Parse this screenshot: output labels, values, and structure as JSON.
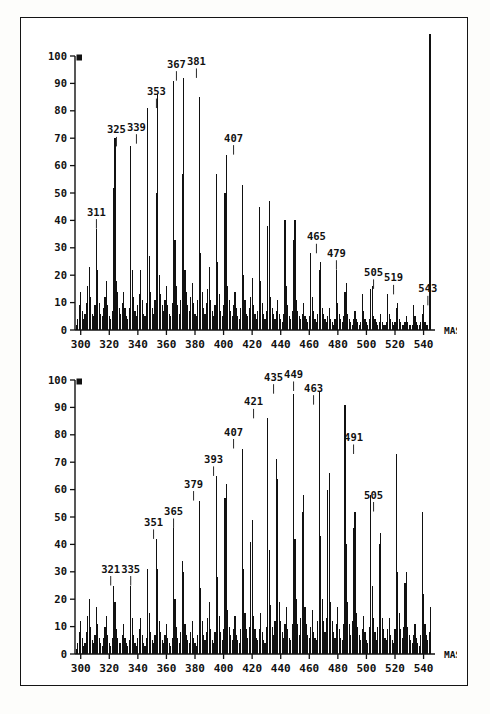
{
  "document": {
    "kind": "mass-spectrum-figure",
    "panel_count": 2,
    "border_color": "#141414",
    "background_color": "#ffffff",
    "ink_color": "#111111"
  },
  "chart_data": [
    {
      "type": "bar",
      "title": "",
      "subtitle": "",
      "xlabel": "MASS",
      "ylabel": "",
      "xlim": [
        296,
        548
      ],
      "ylim": [
        0,
        100
      ],
      "grid": false,
      "legend": "none",
      "xticks": [
        300,
        320,
        340,
        360,
        380,
        400,
        420,
        440,
        460,
        480,
        500,
        520,
        540
      ],
      "yticks": [
        0,
        10,
        20,
        30,
        40,
        50,
        60,
        70,
        80,
        90,
        100
      ],
      "full_scale_marker": "100",
      "annotations": [
        {
          "x": 311,
          "label": "311",
          "y": 37
        },
        {
          "x": 325,
          "label": "325",
          "y": 67
        },
        {
          "x": 339,
          "label": "339",
          "y": 68
        },
        {
          "x": 353,
          "label": "353",
          "y": 81
        },
        {
          "x": 367,
          "label": "367",
          "y": 91
        },
        {
          "x": 381,
          "label": "381",
          "y": 92
        },
        {
          "x": 407,
          "label": "407",
          "y": 64
        },
        {
          "x": 465,
          "label": "465",
          "y": 28
        },
        {
          "x": 479,
          "label": "479",
          "y": 22
        },
        {
          "x": 505,
          "label": "505",
          "y": 15
        },
        {
          "x": 519,
          "label": "519",
          "y": 13
        },
        {
          "x": 543,
          "label": "543",
          "y": 9
        }
      ],
      "x": [
        297,
        298,
        299,
        300,
        301,
        302,
        303,
        304,
        305,
        306,
        307,
        308,
        309,
        310,
        311,
        312,
        313,
        314,
        315,
        316,
        317,
        318,
        319,
        320,
        321,
        322,
        323,
        324,
        325,
        326,
        327,
        328,
        329,
        330,
        331,
        332,
        333,
        334,
        335,
        336,
        337,
        338,
        339,
        340,
        341,
        342,
        343,
        344,
        345,
        346,
        347,
        348,
        349,
        350,
        351,
        352,
        353,
        354,
        355,
        356,
        357,
        358,
        359,
        360,
        361,
        362,
        363,
        364,
        365,
        366,
        367,
        368,
        369,
        370,
        371,
        372,
        373,
        374,
        375,
        376,
        377,
        378,
        379,
        380,
        381,
        382,
        383,
        384,
        385,
        386,
        387,
        388,
        389,
        390,
        391,
        392,
        393,
        394,
        395,
        396,
        397,
        398,
        399,
        400,
        401,
        402,
        403,
        404,
        405,
        406,
        407,
        408,
        409,
        410,
        411,
        412,
        413,
        414,
        415,
        416,
        417,
        418,
        419,
        420,
        421,
        422,
        423,
        424,
        425,
        426,
        427,
        428,
        429,
        430,
        431,
        432,
        433,
        434,
        435,
        436,
        437,
        438,
        439,
        440,
        441,
        442,
        443,
        444,
        445,
        446,
        447,
        448,
        449,
        450,
        451,
        452,
        453,
        454,
        455,
        456,
        457,
        458,
        459,
        460,
        461,
        462,
        463,
        464,
        465,
        466,
        467,
        468,
        469,
        470,
        471,
        472,
        473,
        474,
        475,
        476,
        477,
        478,
        479,
        480,
        481,
        482,
        483,
        484,
        485,
        486,
        487,
        488,
        489,
        490,
        491,
        492,
        493,
        494,
        495,
        496,
        497,
        498,
        499,
        500,
        501,
        502,
        503,
        504,
        505,
        506,
        507,
        508,
        509,
        510,
        511,
        512,
        513,
        514,
        515,
        516,
        517,
        518,
        519,
        520,
        521,
        522,
        523,
        524,
        525,
        526,
        527,
        528,
        529,
        530,
        531,
        532,
        533,
        534,
        535,
        536,
        537,
        538,
        539,
        540,
        541,
        542,
        543,
        544,
        545
      ],
      "values": [
        2,
        4,
        9,
        14,
        7,
        4,
        6,
        10,
        16,
        23,
        12,
        6,
        5,
        9,
        37,
        22,
        10,
        6,
        5,
        8,
        12,
        18,
        9,
        5,
        4,
        7,
        52,
        70,
        18,
        14,
        8,
        6,
        10,
        14,
        8,
        5,
        4,
        8,
        67,
        22,
        12,
        7,
        5,
        9,
        13,
        22,
        11,
        6,
        5,
        10,
        81,
        27,
        14,
        8,
        6,
        11,
        50,
        86,
        20,
        13,
        9,
        7,
        11,
        16,
        9,
        6,
        5,
        10,
        91,
        33,
        16,
        9,
        6,
        11,
        57,
        92,
        22,
        14,
        9,
        7,
        12,
        17,
        10,
        6,
        5,
        11,
        85,
        28,
        14,
        8,
        6,
        10,
        15,
        23,
        11,
        7,
        5,
        9,
        57,
        25,
        13,
        7,
        5,
        9,
        50,
        64,
        16,
        11,
        7,
        5,
        9,
        14,
        8,
        5,
        4,
        8,
        53,
        20,
        11,
        6,
        5,
        8,
        12,
        19,
        9,
        6,
        4,
        7,
        45,
        18,
        10,
        6,
        4,
        7,
        38,
        47,
        12,
        8,
        6,
        4,
        7,
        11,
        6,
        4,
        3,
        6,
        40,
        16,
        9,
        5,
        4,
        7,
        33,
        40,
        11,
        7,
        5,
        4,
        6,
        10,
        5,
        4,
        3,
        5,
        28,
        12,
        7,
        4,
        3,
        6,
        22,
        25,
        8,
        6,
        4,
        3,
        5,
        8,
        4,
        3,
        2,
        4,
        22,
        10,
        6,
        4,
        3,
        5,
        14,
        17,
        6,
        4,
        3,
        2,
        4,
        7,
        4,
        3,
        2,
        3,
        13,
        7,
        4,
        3,
        2,
        4,
        15,
        16,
        5,
        4,
        3,
        2,
        3,
        6,
        3,
        2,
        2,
        3,
        13,
        6,
        4,
        3,
        2,
        3,
        8,
        10,
        4,
        3,
        2,
        2,
        3,
        5,
        3,
        2,
        2,
        2,
        9,
        5,
        3,
        2,
        2,
        3,
        6,
        9,
        3,
        2,
        2
      ]
    },
    {
      "type": "bar",
      "title": "",
      "subtitle": "",
      "xlabel": "MASS",
      "ylabel": "",
      "xlim": [
        296,
        548
      ],
      "ylim": [
        0,
        100
      ],
      "grid": false,
      "legend": "none",
      "xticks": [
        300,
        320,
        340,
        360,
        380,
        400,
        420,
        440,
        460,
        480,
        500,
        520,
        540
      ],
      "yticks": [
        0,
        10,
        20,
        30,
        40,
        50,
        60,
        70,
        80,
        90,
        100
      ],
      "full_scale_marker": "100",
      "annotations": [
        {
          "x": 321,
          "label": "321",
          "y": 25
        },
        {
          "x": 335,
          "label": "335",
          "y": 25
        },
        {
          "x": 351,
          "label": "351",
          "y": 42
        },
        {
          "x": 365,
          "label": "365",
          "y": 46
        },
        {
          "x": 379,
          "label": "379",
          "y": 56
        },
        {
          "x": 393,
          "label": "393",
          "y": 65
        },
        {
          "x": 407,
          "label": "407",
          "y": 75
        },
        {
          "x": 421,
          "label": "421",
          "y": 86
        },
        {
          "x": 435,
          "label": "435",
          "y": 95
        },
        {
          "x": 449,
          "label": "449",
          "y": 96
        },
        {
          "x": 463,
          "label": "463",
          "y": 91
        },
        {
          "x": 491,
          "label": "491",
          "y": 73
        },
        {
          "x": 505,
          "label": "505",
          "y": 52
        }
      ],
      "x": [
        297,
        298,
        299,
        300,
        301,
        302,
        303,
        304,
        305,
        306,
        307,
        308,
        309,
        310,
        311,
        312,
        313,
        314,
        315,
        316,
        317,
        318,
        319,
        320,
        321,
        322,
        323,
        324,
        325,
        326,
        327,
        328,
        329,
        330,
        331,
        332,
        333,
        334,
        335,
        336,
        337,
        338,
        339,
        340,
        341,
        342,
        343,
        344,
        345,
        346,
        347,
        348,
        349,
        350,
        351,
        352,
        353,
        354,
        355,
        356,
        357,
        358,
        359,
        360,
        361,
        362,
        363,
        364,
        365,
        366,
        367,
        368,
        369,
        370,
        371,
        372,
        373,
        374,
        375,
        376,
        377,
        378,
        379,
        380,
        381,
        382,
        383,
        384,
        385,
        386,
        387,
        388,
        389,
        390,
        391,
        392,
        393,
        394,
        395,
        396,
        397,
        398,
        399,
        400,
        401,
        402,
        403,
        404,
        405,
        406,
        407,
        408,
        409,
        410,
        411,
        412,
        413,
        414,
        415,
        416,
        417,
        418,
        419,
        420,
        421,
        422,
        423,
        424,
        425,
        426,
        427,
        428,
        429,
        430,
        431,
        432,
        433,
        434,
        435,
        436,
        437,
        438,
        439,
        440,
        441,
        442,
        443,
        444,
        445,
        446,
        447,
        448,
        449,
        450,
        451,
        452,
        453,
        454,
        455,
        456,
        457,
        458,
        459,
        460,
        461,
        462,
        463,
        464,
        465,
        466,
        467,
        468,
        469,
        470,
        471,
        472,
        473,
        474,
        475,
        476,
        477,
        478,
        479,
        480,
        481,
        482,
        483,
        484,
        485,
        486,
        487,
        488,
        489,
        490,
        491,
        492,
        493,
        494,
        495,
        496,
        497,
        498,
        499,
        500,
        501,
        502,
        503,
        504,
        505,
        506,
        507,
        508,
        509,
        510,
        511,
        512,
        513,
        514,
        515,
        516,
        517,
        518,
        519,
        520,
        521,
        522,
        523,
        524,
        525,
        526,
        527,
        528,
        529,
        530,
        531,
        532,
        533,
        534,
        535,
        536,
        537,
        538,
        539,
        540,
        541,
        542,
        543,
        544,
        545
      ],
      "values": [
        2,
        4,
        8,
        12,
        6,
        3,
        4,
        8,
        14,
        20,
        10,
        5,
        4,
        7,
        17,
        11,
        6,
        4,
        3,
        6,
        10,
        14,
        7,
        4,
        3,
        6,
        25,
        19,
        9,
        6,
        4,
        4,
        7,
        11,
        6,
        4,
        3,
        5,
        25,
        13,
        7,
        4,
        3,
        6,
        9,
        13,
        7,
        4,
        3,
        6,
        31,
        15,
        8,
        5,
        4,
        7,
        42,
        31,
        12,
        8,
        5,
        4,
        7,
        11,
        6,
        4,
        3,
        6,
        46,
        20,
        10,
        6,
        4,
        8,
        34,
        30,
        11,
        7,
        5,
        4,
        8,
        12,
        6,
        4,
        3,
        7,
        56,
        24,
        12,
        7,
        5,
        8,
        13,
        19,
        9,
        5,
        4,
        8,
        65,
        28,
        14,
        8,
        5,
        9,
        57,
        62,
        16,
        10,
        7,
        5,
        9,
        14,
        7,
        5,
        4,
        9,
        75,
        31,
        15,
        9,
        6,
        10,
        41,
        49,
        14,
        9,
        6,
        5,
        9,
        15,
        8,
        5,
        4,
        10,
        86,
        38,
        18,
        10,
        7,
        12,
        71,
        64,
        19,
        12,
        8,
        6,
        11,
        17,
        9,
        6,
        5,
        11,
        95,
        42,
        20,
        11,
        7,
        13,
        52,
        58,
        17,
        11,
        7,
        6,
        10,
        16,
        8,
        6,
        5,
        12,
        96,
        43,
        20,
        12,
        8,
        13,
        60,
        66,
        19,
        12,
        8,
        6,
        11,
        17,
        9,
        6,
        5,
        11,
        91,
        40,
        19,
        11,
        7,
        12,
        46,
        52,
        15,
        10,
        7,
        5,
        9,
        14,
        8,
        5,
        4,
        10,
        58,
        25,
        13,
        8,
        5,
        10,
        40,
        44,
        13,
        9,
        6,
        5,
        9,
        13,
        7,
        5,
        4,
        9,
        73,
        30,
        15,
        9,
        6,
        10,
        26,
        30,
        10,
        7,
        5,
        4,
        7,
        11,
        6,
        4,
        3,
        7,
        52,
        22,
        11,
        7,
        5,
        8,
        17,
        20,
        7,
        5,
        4,
        3,
        6,
        9,
        5,
        3,
        3,
        6,
        14,
        8,
        5,
        3,
        3,
        5,
        9,
        11,
        4,
        3,
        3
      ]
    }
  ],
  "panels": [
    {
      "name": "top-spectrum",
      "index": 0
    },
    {
      "name": "bottom-spectrum",
      "index": 1
    }
  ]
}
